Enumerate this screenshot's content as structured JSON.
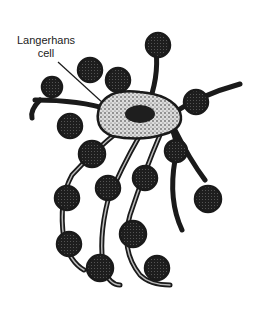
{
  "figure": {
    "label_line1": "Langerhans",
    "label_line2": "cell",
    "colors": {
      "ink": "#1a1a1a",
      "background": "#ffffff",
      "stipple": "#e8e8e8"
    }
  }
}
